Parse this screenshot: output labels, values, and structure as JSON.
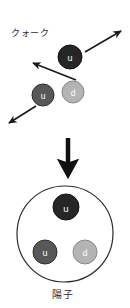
{
  "figure": {
    "title_top": "クォーク",
    "title_bottom": "陽子",
    "background_color": "#ffffff",
    "free_quarks": [
      {
        "flavor": "u",
        "cx": 70,
        "cy": 57,
        "r": 12,
        "fill": "#262626",
        "stroke": "#111111",
        "text_color": "#ffffff"
      },
      {
        "flavor": "u",
        "cx": 43,
        "cy": 95,
        "r": 11,
        "fill": "#585858",
        "stroke": "#2e2e2e",
        "text_color": "#ffffff"
      },
      {
        "flavor": "d",
        "cx": 73,
        "cy": 92,
        "r": 11,
        "fill": "#b4b4b4",
        "stroke": "#8a8a8a",
        "text_color": "#ffffff"
      }
    ],
    "motion_arrows": [
      {
        "name": "arrow-up-right",
        "x1": 85,
        "y1": 52,
        "x2": 122,
        "y2": 30
      },
      {
        "name": "arrow-up-left",
        "x1": 75,
        "y1": 80,
        "x2": 32,
        "y2": 62
      },
      {
        "name": "arrow-down-left",
        "x1": 36,
        "y1": 106,
        "x2": 8,
        "y2": 124
      }
    ],
    "transition_arrow": {
      "name": "arrow-down-thick",
      "x": 68,
      "y_top": 138,
      "y_bottom": 174
    },
    "proton": {
      "cx": 65,
      "cy": 234,
      "r": 48,
      "stroke": "#2b2b2b",
      "fill": "#ffffff",
      "quarks": [
        {
          "flavor": "u",
          "cx": 66,
          "cy": 207,
          "r": 13,
          "fill": "#262626",
          "stroke": "#111111",
          "text_color": "#ffffff"
        },
        {
          "flavor": "u",
          "cx": 45,
          "cy": 252,
          "r": 12,
          "fill": "#585858",
          "stroke": "#2e2e2e",
          "text_color": "#ffffff"
        },
        {
          "flavor": "d",
          "cx": 85,
          "cy": 252,
          "r": 12,
          "fill": "#b4b4b4",
          "stroke": "#8a8a8a",
          "text_color": "#ffffff"
        }
      ]
    }
  }
}
